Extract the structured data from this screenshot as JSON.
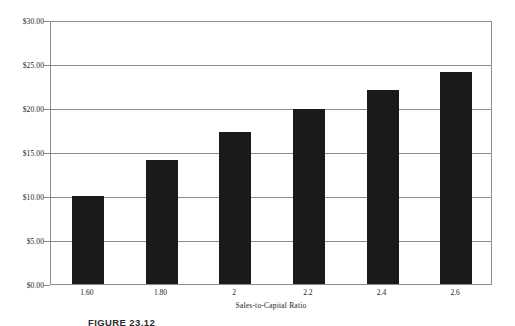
{
  "chart_data": {
    "type": "bar",
    "title": "",
    "categories": [
      "1.60",
      "1.80",
      "2",
      "2.2",
      "2.4",
      "2.6"
    ],
    "values": [
      10.0,
      14.1,
      17.3,
      19.9,
      22.1,
      24.1
    ],
    "xlabel": "Sales-to-Capital Ratio",
    "ylabel": "Value per Share",
    "ylim": [
      0,
      30
    ],
    "ytick_step": 5,
    "ytick_labels": [
      "$30.00",
      "$25.00",
      "$20.00",
      "$15.00",
      "$10.00",
      "$5.00",
      "$0.00"
    ],
    "ytick_values": [
      30,
      25,
      20,
      15,
      10,
      5,
      0
    ],
    "grid": true,
    "grid_axis": "y",
    "legend": false,
    "bar_color": "#1a1a1a",
    "grid_color": "#8c8c8c",
    "plot_background": "#ffffff"
  },
  "caption": {
    "text": "FIGURE 23.12"
  }
}
